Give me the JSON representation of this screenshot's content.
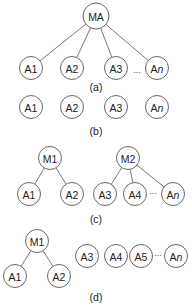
{
  "panels": [
    {
      "id": "a",
      "caption": "(a)",
      "caption_pos": [
        96,
        87
      ],
      "nodes": [
        {
          "id": "MA",
          "label": "MA",
          "x": 96,
          "y": 16,
          "r": 13
        },
        {
          "id": "A1",
          "label": "A1",
          "x": 31,
          "y": 68,
          "r": 11.5
        },
        {
          "id": "A2",
          "label": "A2",
          "x": 72,
          "y": 68,
          "r": 11.5
        },
        {
          "id": "A3",
          "label": "A3",
          "x": 116,
          "y": 68,
          "r": 11.5
        },
        {
          "id": "An",
          "label": "An",
          "x": 157,
          "y": 68,
          "r": 11.5
        }
      ],
      "edges": [
        [
          "MA",
          "A1"
        ],
        [
          "MA",
          "A2"
        ],
        [
          "MA",
          "A3"
        ],
        [
          "MA",
          "An"
        ]
      ],
      "ellipses": [
        {
          "text": "...",
          "x": 137,
          "y": 70
        }
      ]
    },
    {
      "id": "b",
      "caption": "(b)",
      "caption_pos": [
        96,
        131
      ],
      "nodes": [
        {
          "id": "A1",
          "label": "A1",
          "x": 31,
          "y": 107,
          "r": 11.5
        },
        {
          "id": "A2",
          "label": "A2",
          "x": 72,
          "y": 107,
          "r": 11.5
        },
        {
          "id": "A3",
          "label": "A3",
          "x": 116,
          "y": 107,
          "r": 11.5
        },
        {
          "id": "An",
          "label": "An",
          "x": 157,
          "y": 107,
          "r": 11.5
        }
      ],
      "edges": [],
      "ellipses": []
    },
    {
      "id": "c",
      "caption": "(c)",
      "caption_pos": [
        96,
        219
      ],
      "nodes": [
        {
          "id": "M1",
          "label": "M1",
          "x": 50,
          "y": 158,
          "r": 11.5
        },
        {
          "id": "A1",
          "label": "A1",
          "x": 29,
          "y": 194,
          "r": 11.5
        },
        {
          "id": "A2",
          "label": "A2",
          "x": 72,
          "y": 194,
          "r": 11.5
        },
        {
          "id": "M2",
          "label": "M2",
          "x": 128,
          "y": 158,
          "r": 11.5
        },
        {
          "id": "A3",
          "label": "A3",
          "x": 105,
          "y": 194,
          "r": 11.5
        },
        {
          "id": "A4",
          "label": "A4",
          "x": 135,
          "y": 194,
          "r": 11.5
        },
        {
          "id": "An",
          "label": "An",
          "x": 173,
          "y": 194,
          "r": 11.5
        }
      ],
      "edges": [
        [
          "M1",
          "A1"
        ],
        [
          "M1",
          "A2"
        ],
        [
          "M2",
          "A3"
        ],
        [
          "M2",
          "A4"
        ],
        [
          "M2",
          "An"
        ]
      ],
      "ellipses": [
        {
          "text": "...",
          "x": 153,
          "y": 191
        }
      ]
    },
    {
      "id": "d",
      "caption": "(d)",
      "caption_pos": [
        96,
        297
      ],
      "nodes": [
        {
          "id": "M1",
          "label": "M1",
          "x": 37,
          "y": 241,
          "r": 11.5
        },
        {
          "id": "A1",
          "label": "A1",
          "x": 15,
          "y": 276,
          "r": 11.5
        },
        {
          "id": "A2",
          "label": "A2",
          "x": 59,
          "y": 276,
          "r": 11.5
        },
        {
          "id": "A3",
          "label": "A3",
          "x": 87,
          "y": 256,
          "r": 11.5
        },
        {
          "id": "A4",
          "label": "A4",
          "x": 116,
          "y": 256,
          "r": 11.5
        },
        {
          "id": "A5",
          "label": "A5",
          "x": 141,
          "y": 256,
          "r": 11.5
        },
        {
          "id": "An",
          "label": "An",
          "x": 176,
          "y": 256,
          "r": 11.5
        }
      ],
      "edges": [
        [
          "M1",
          "A1"
        ],
        [
          "M1",
          "A2"
        ]
      ],
      "ellipses": [
        {
          "text": "...",
          "x": 158,
          "y": 253
        }
      ]
    }
  ]
}
